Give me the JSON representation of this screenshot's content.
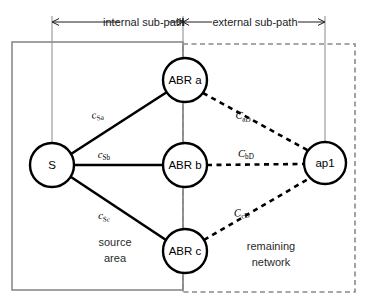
{
  "diagram": {
    "colors": {
      "node_stroke": "#000000",
      "node_fill": "#ffffff",
      "solid_edge": "#000000",
      "dashed_edge": "#000000",
      "area_box_solid": "#8a8a8a",
      "area_box_dashed": "#8a8a8a",
      "guide_line": "#8a8a8a",
      "span_arrow": "#1c1c1c",
      "text": "#000000"
    },
    "spans": [
      {
        "id": "internal",
        "label": "internal sub-path",
        "x_start": 52,
        "x_end": 183,
        "y": 22
      },
      {
        "id": "external",
        "label": "external sub-path",
        "x_start": 183,
        "x_end": 325,
        "y": 22
      }
    ],
    "areas": [
      {
        "id": "source-area",
        "label_line1": "source",
        "label_line2": "area",
        "border": "solid",
        "x": 12,
        "y": 42,
        "width": 171,
        "height": 248,
        "label_x": 115,
        "label_y": 246
      },
      {
        "id": "remaining-network",
        "label_line1": "remaining",
        "label_line2": "network",
        "border": "dashed",
        "x": 183,
        "y": 44,
        "width": 172,
        "height": 248,
        "label_x": 271,
        "label_y": 250
      }
    ],
    "nodes": [
      {
        "id": "s",
        "label": "S",
        "cx": 52,
        "cy": 165,
        "r": 22
      },
      {
        "id": "abr-a",
        "label": "ABR a",
        "cx": 185,
        "cy": 80,
        "r": 22
      },
      {
        "id": "abr-b",
        "label": "ABR b",
        "cx": 185,
        "cy": 165,
        "r": 22
      },
      {
        "id": "abr-c",
        "label": "ABR c",
        "cx": 185,
        "cy": 251,
        "r": 22
      },
      {
        "id": "ap1",
        "label": "ap1",
        "cx": 325,
        "cy": 163,
        "r": 21
      }
    ],
    "edges": [
      {
        "id": "s-abr-a",
        "from": "S",
        "to": "ABR a",
        "style": "solid",
        "label_main": "c",
        "label_sub": "Sa",
        "x1": 71,
        "y1": 154,
        "x2": 167,
        "y2": 92,
        "label_x": 98,
        "label_y": 118
      },
      {
        "id": "s-abr-b",
        "from": "S",
        "to": "ABR b",
        "style": "solid",
        "label_main": "c",
        "label_sub": "Sb",
        "x1": 74,
        "y1": 165,
        "x2": 163,
        "y2": 165,
        "label_x": 104,
        "label_y": 158
      },
      {
        "id": "s-abr-c",
        "from": "S",
        "to": "ABR c",
        "style": "solid",
        "label_main": "c",
        "label_sub": "Sc",
        "x1": 71,
        "y1": 177,
        "x2": 166,
        "y2": 240,
        "label_x": 104,
        "label_y": 219
      },
      {
        "id": "abr-a-ap1",
        "from": "ABR a",
        "to": "ap1",
        "style": "dashed",
        "label_main": "C",
        "label_sub": "aD",
        "x1": 203,
        "y1": 93,
        "x2": 309,
        "y2": 151,
        "label_x": 243,
        "label_y": 119
      },
      {
        "id": "abr-b-ap1",
        "from": "ABR b",
        "to": "ap1",
        "style": "dashed",
        "label_main": "C",
        "label_sub": "bD",
        "x1": 207,
        "y1": 165,
        "x2": 304,
        "y2": 164,
        "label_x": 246,
        "label_y": 157
      },
      {
        "id": "abr-c-ap1",
        "from": "ABR c",
        "to": "ap1",
        "style": "dashed",
        "label_main": "C",
        "label_sub": "cD",
        "x1": 204,
        "y1": 240,
        "x2": 310,
        "y2": 178,
        "label_x": 242,
        "label_y": 216
      }
    ],
    "guides": [
      {
        "id": "guide-s",
        "x": 52,
        "y1": 16,
        "y2": 144
      },
      {
        "id": "guide-abr",
        "x": 183,
        "y1": 16,
        "y2": 292
      },
      {
        "id": "guide-ap1",
        "x": 325,
        "y1": 16,
        "y2": 143
      }
    ]
  }
}
